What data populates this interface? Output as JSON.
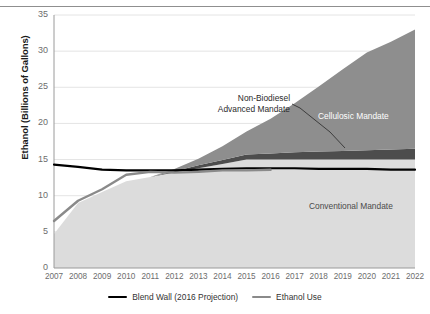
{
  "chart_data": {
    "type": "area",
    "title": "",
    "xlabel": "",
    "ylabel": "Ethanol (Billions of Gallons)",
    "xlim": [
      2007,
      2022
    ],
    "ylim": [
      0,
      35
    ],
    "grid": true,
    "legend_position": "bottom",
    "x": [
      2007,
      2008,
      2009,
      2010,
      2011,
      2012,
      2013,
      2014,
      2015,
      2016,
      2017,
      2018,
      2019,
      2020,
      2021,
      2022
    ],
    "xticklabels": [
      "2007",
      "2008",
      "2009",
      "2010",
      "2011",
      "2012",
      "2013",
      "2014",
      "2015",
      "2016",
      "2017",
      "2018",
      "2019",
      "2020",
      "2021",
      "2022"
    ],
    "yticklabels": [
      "0",
      "5",
      "10",
      "15",
      "20",
      "25",
      "30",
      "35"
    ],
    "ytickvalues": [
      0,
      5,
      10,
      15,
      20,
      25,
      30,
      35
    ],
    "stacked_series": [
      {
        "name": "Conventional Mandate",
        "color": "#dcdcdc",
        "values": [
          4.7,
          9.0,
          10.5,
          12.0,
          12.6,
          13.2,
          13.8,
          14.4,
          15.0,
          15.0,
          15.0,
          15.0,
          15.0,
          15.0,
          15.0,
          15.0
        ]
      },
      {
        "name": "Non-Biodiesel Advanced Mandate",
        "color": "#4d4d4d",
        "values": [
          0.0,
          0.0,
          0.0,
          0.0,
          0.0,
          0.2,
          0.4,
          0.55,
          0.7,
          0.85,
          1.0,
          1.1,
          1.2,
          1.3,
          1.4,
          1.5
        ]
      },
      {
        "name": "Cellulosic Mandate",
        "color": "#8e8e8e",
        "values": [
          0.0,
          0.0,
          0.0,
          0.0,
          0.0,
          0.3,
          0.9,
          1.9,
          3.2,
          4.8,
          6.8,
          9.0,
          11.3,
          13.5,
          14.9,
          16.5
        ]
      }
    ],
    "lines": [
      {
        "name": "Blend Wall (2016 Projection)",
        "color": "#000000",
        "width": 2.2,
        "x": [
          2007,
          2008,
          2009,
          2010,
          2011,
          2012,
          2013,
          2014,
          2015,
          2016,
          2017,
          2018,
          2019,
          2020,
          2021,
          2022
        ],
        "values": [
          14.3,
          14.0,
          13.6,
          13.5,
          13.5,
          13.5,
          13.6,
          13.7,
          13.8,
          13.8,
          13.8,
          13.7,
          13.7,
          13.7,
          13.6,
          13.6
        ]
      },
      {
        "name": "Ethanol Use",
        "color": "#8a8a8a",
        "width": 2.4,
        "x": [
          2007,
          2008,
          2009,
          2010,
          2011,
          2012,
          2013,
          2014,
          2015,
          2016
        ],
        "values": [
          6.5,
          9.3,
          10.9,
          12.9,
          13.3,
          13.2,
          13.3,
          13.5,
          13.5,
          13.6
        ]
      }
    ],
    "annotations": [
      {
        "name": "non-biodiesel-advanced-mandate",
        "text": "Non-Biodiesel\nAdvanced Mandate",
        "color": "#2a2a2a",
        "has_leader_line": true
      },
      {
        "name": "cellulosic-mandate",
        "text": "Cellulosic Mandate",
        "color": "#ffffff",
        "has_leader_line": false
      },
      {
        "name": "conventional-mandate",
        "text": "Conventional Mandate",
        "color": "#4a4a4a",
        "has_leader_line": false
      }
    ],
    "legend": [
      {
        "label": "Blend Wall (2016 Projection)",
        "color": "#000000"
      },
      {
        "label": "Ethanol Use",
        "color": "#8a8a8a"
      }
    ]
  },
  "annotation_text": {
    "advanced_line1": "Non-Biodiesel",
    "advanced_line2": "Advanced Mandate",
    "cellulosic": "Cellulosic Mandate",
    "conventional": "Conventional Mandate"
  }
}
